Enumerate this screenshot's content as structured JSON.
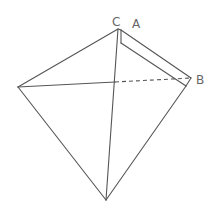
{
  "diagram": {
    "type": "folded-tetrahedron-figure",
    "labels": {
      "C": "C",
      "A": "A",
      "B": "B"
    },
    "vertices": {
      "apex": [
        118,
        29
      ],
      "left": [
        18,
        87
      ],
      "bottom": [
        106,
        200
      ],
      "right": [
        191,
        78
      ],
      "fold_top": [
        121,
        43
      ],
      "fold_right": [
        186,
        86
      ],
      "center": [
        115,
        82
      ]
    },
    "line_color": "#555555",
    "label_color": "#666666"
  }
}
